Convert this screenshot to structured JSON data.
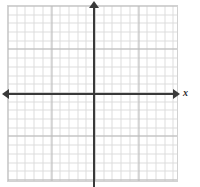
{
  "figure": {
    "name": "blank-coordinate-plane",
    "width": 200,
    "height": 187,
    "background_color": "#ffffff"
  },
  "chart_data": {
    "type": "scatter",
    "title": "",
    "subtitle": "",
    "xlabel": "x",
    "ylabel": "",
    "series": [
      {
        "name": "",
        "x": [],
        "y": []
      }
    ],
    "x": [],
    "values": [],
    "categories": [],
    "xlim": [
      -10,
      10
    ],
    "ylim": [
      -10,
      10
    ],
    "xticks": [],
    "yticks": [],
    "xtick_labels": [],
    "ytick_labels": [],
    "grid": true,
    "grid_minor": true,
    "grid_minor_spacing_px": 8.7,
    "grid_major_every": 5,
    "grid_minor_color": "#dcdcdc",
    "grid_major_color": "#b9b9b9",
    "legend": false,
    "legend_position": "none",
    "annotations": []
  },
  "axes": {
    "x_axis": {
      "label": "x",
      "color": "#3a3a3a",
      "arrow_left": true,
      "arrow_right": true
    },
    "y_axis": {
      "label": "",
      "color": "#3a3a3a",
      "arrow_top": true,
      "arrow_bottom": false
    },
    "origin_label": ""
  },
  "grid_area": {
    "border_color": "#d2d2d2"
  }
}
